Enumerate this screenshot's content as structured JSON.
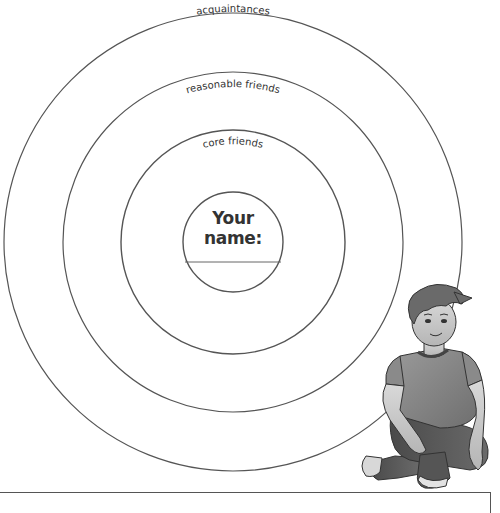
{
  "diagram": {
    "rings": [
      {
        "label": "acquaintances",
        "radius": 229
      },
      {
        "label": "reasonable friends",
        "radius": 170
      },
      {
        "label": "core friends",
        "radius": 112
      }
    ],
    "center": {
      "label": "Your name:",
      "value": "",
      "radius": 50
    },
    "illustration": "boy-sitting-cross-legged",
    "colors": {
      "line": "#555555",
      "text": "#333333",
      "background": "#ffffff"
    }
  }
}
